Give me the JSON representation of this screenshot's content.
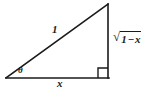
{
  "figure": {
    "background_color": "#ffffff",
    "stroke_color": "#1a1a1a",
    "geometry": {
      "left_vertex": [
        6,
        78
      ],
      "right_vertex": [
        108,
        78
      ],
      "apex_vertex": [
        108,
        4
      ],
      "right_angle_marker": {
        "x": 98,
        "y": 68,
        "size": 10,
        "at_vertex": "bottom-right"
      }
    },
    "labels": {
      "hypotenuse": "1",
      "base": "x",
      "angle": "θ",
      "vertical_radical_sign": "√",
      "vertical_radicand_first": "1",
      "vertical_radicand_operator": "−",
      "vertical_radicand_second": "x",
      "vertical_full": "√(1 − x)"
    }
  }
}
